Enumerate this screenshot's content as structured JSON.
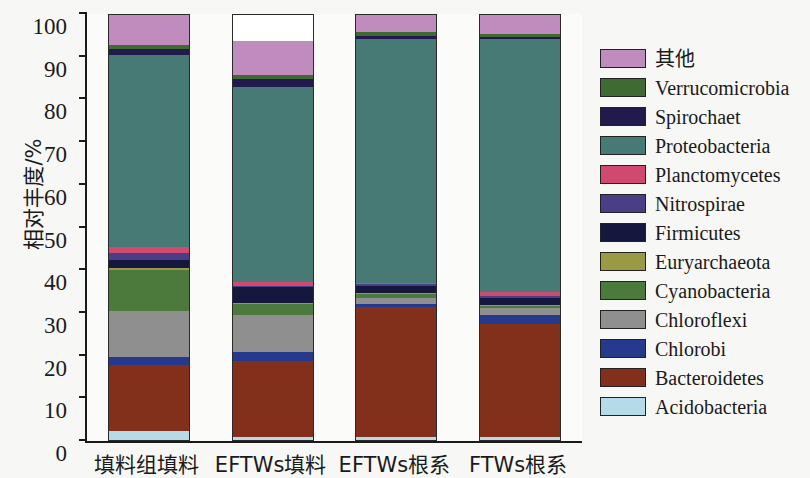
{
  "axes": {
    "y_title": "相对丰度/%",
    "y_ticks": [
      0,
      10,
      20,
      30,
      40,
      50,
      60,
      70,
      80,
      90,
      100
    ],
    "x_labels": [
      "填料组填料",
      "EFTWs填料",
      "EFTWs根系",
      "FTWs根系"
    ]
  },
  "legend": {
    "items": [
      {
        "label": "其他",
        "color": "#c08cbd",
        "cjk": true
      },
      {
        "label": "Verrucomicrobia",
        "color": "#3f6b33",
        "cjk": false
      },
      {
        "label": "Spirochaet",
        "color": "#221a4d",
        "cjk": false
      },
      {
        "label": "Proteobacteria",
        "color": "#477a74",
        "cjk": false
      },
      {
        "label": "Planctomycetes",
        "color": "#cf4a6e",
        "cjk": false
      },
      {
        "label": "Nitrospirae",
        "color": "#4a3f86",
        "cjk": false
      },
      {
        "label": "Firmicutes",
        "color": "#15173f",
        "cjk": false
      },
      {
        "label": "Euryarchaeota",
        "color": "#9a9a44",
        "cjk": false
      },
      {
        "label": "Cyanobacteria",
        "color": "#4b7a3c",
        "cjk": false
      },
      {
        "label": "Chloroflexi",
        "color": "#8f8f8f",
        "cjk": false
      },
      {
        "label": "Chlorobi",
        "color": "#27398c",
        "cjk": false
      },
      {
        "label": "Bacteroidetes",
        "color": "#82301b",
        "cjk": false
      },
      {
        "label": "Acidobacteria",
        "color": "#b6dbe8",
        "cjk": false
      }
    ]
  },
  "chart_data": {
    "type": "bar",
    "stacked": true,
    "title": "",
    "xlabel": "",
    "ylabel": "相对丰度/%",
    "ylim": [
      0,
      100
    ],
    "grid": false,
    "legend_position": "right",
    "categories": [
      "填料组填料",
      "EFTWs填料",
      "EFTWs根系",
      "FTWs根系"
    ],
    "series": [
      {
        "name": "Acidobacteria",
        "color": "#b6dbe8",
        "values": [
          2.2,
          0.8,
          0.7,
          0.7
        ]
      },
      {
        "name": "Bacteroidetes",
        "color": "#82301b",
        "values": [
          15.5,
          17.8,
          30.5,
          26.5
        ]
      },
      {
        "name": "Chlorobi",
        "color": "#27398c",
        "values": [
          1.8,
          2.2,
          0.9,
          2.3
        ]
      },
      {
        "name": "Chloroflexi",
        "color": "#8f8f8f",
        "values": [
          10.8,
          8.5,
          1.2,
          1.6
        ]
      },
      {
        "name": "Cyanobacteria",
        "color": "#4b7a3c",
        "values": [
          9.8,
          2.6,
          1.0,
          0.4
        ]
      },
      {
        "name": "Euryarchaeota",
        "color": "#9a9a44",
        "values": [
          0.4,
          0.4,
          0.3,
          0.3
        ]
      },
      {
        "name": "Firmicutes",
        "color": "#15173f",
        "values": [
          1.9,
          3.6,
          1.7,
          1.7
        ]
      },
      {
        "name": "Nitrospirae",
        "color": "#4a3f86",
        "values": [
          1.5,
          0.4,
          0.3,
          0.3
        ]
      },
      {
        "name": "Planctomycetes",
        "color": "#cf4a6e",
        "values": [
          1.6,
          0.8,
          0.3,
          1.1
        ]
      },
      {
        "name": "Proteobacteria",
        "color": "#477a74",
        "values": [
          45.0,
          45.9,
          57.5,
          59.4
        ]
      },
      {
        "name": "Spirochaet",
        "color": "#221a4d",
        "values": [
          1.4,
          1.9,
          0.6,
          0.5
        ]
      },
      {
        "name": "Verrucomicrobia",
        "color": "#3f6b33",
        "values": [
          1.1,
          1.1,
          0.9,
          0.7
        ]
      },
      {
        "name": "其他",
        "color": "#c08cbd",
        "values": [
          7.0,
          8.0,
          4.1,
          4.5
        ]
      }
    ]
  }
}
